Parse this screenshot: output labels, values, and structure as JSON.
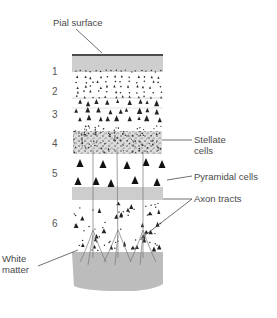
{
  "figure": {
    "labels": {
      "pial_surface": "Pial surface",
      "stellate_line1": "Stellate",
      "stellate_line2": "cells",
      "pyramidal": "Pyramidal cells",
      "axon": "Axon tracts",
      "white_line1": "White",
      "white_line2": "matter"
    },
    "layers": [
      {
        "number": "1",
        "y": 66
      },
      {
        "number": "2",
        "y": 86
      },
      {
        "number": "3",
        "y": 109
      },
      {
        "number": "4",
        "y": 138
      },
      {
        "number": "5",
        "y": 168
      },
      {
        "number": "6",
        "y": 218
      }
    ],
    "colors": {
      "ink": "#222222",
      "hatch": "#8a8a8a",
      "stipple_bg": "#d8d8d8",
      "label_text": "#4a4a4a",
      "leader": "#333333"
    }
  }
}
